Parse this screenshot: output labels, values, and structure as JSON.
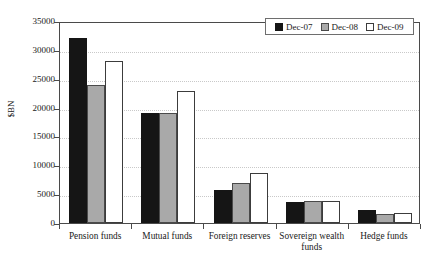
{
  "chart_data": {
    "type": "bar",
    "title": "",
    "xlabel": "",
    "ylabel": "$BN",
    "ylim": [
      0,
      35000
    ],
    "ytick_step": 5000,
    "yticks": [
      0,
      5000,
      10000,
      15000,
      20000,
      25000,
      30000,
      35000
    ],
    "ytick_labels": [
      "0",
      "5000",
      "10000",
      "15000",
      "20000",
      "25000",
      "30000",
      "35000"
    ],
    "grid": true,
    "grid_axis": "y",
    "grid_style": "dotted",
    "legend_position": "top-right",
    "categories": [
      "Pension funds",
      "Mutual funds",
      "Foreign reserves",
      "Sovereign wealth funds",
      "Hedge funds"
    ],
    "category_label_lines": [
      [
        "Pension funds"
      ],
      [
        "Mutual funds"
      ],
      [
        "Foreign reserves"
      ],
      [
        "Sovereign wealth",
        "funds"
      ],
      [
        "Hedge funds"
      ]
    ],
    "series": [
      {
        "name": "Dec-07",
        "color": "#151515",
        "values": [
          32000,
          19000,
          5800,
          3700,
          2300
        ]
      },
      {
        "name": "Dec-08",
        "color": "#a9a9a9",
        "values": [
          24000,
          19000,
          7000,
          3800,
          1500
        ]
      },
      {
        "name": "Dec-09",
        "color": "#ffffff",
        "values": [
          28000,
          22800,
          8700,
          3800,
          1800
        ]
      }
    ]
  },
  "legend": {
    "items": [
      {
        "label": "Dec-07"
      },
      {
        "label": "Dec-08"
      },
      {
        "label": "Dec-09"
      }
    ]
  },
  "axes": {
    "y_title": "$BN"
  }
}
